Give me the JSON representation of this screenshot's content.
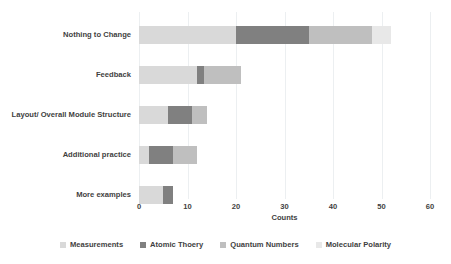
{
  "chart_data": {
    "type": "bar",
    "orientation": "horizontal",
    "stacked": true,
    "title": "",
    "xlabel": "Counts",
    "ylabel": "",
    "xlim": [
      0,
      60
    ],
    "ylim": null,
    "xticks": [
      "0",
      "10",
      "20",
      "30",
      "40",
      "50",
      "60"
    ],
    "grid": "vertical",
    "legend_position": "bottom",
    "categories": [
      "Nothing to Change",
      "Feedback",
      "Layout/ Overall Module Structure",
      "Additional practice",
      "More examples"
    ],
    "series": [
      {
        "name": "Measurements",
        "color": "#d9d9d9",
        "values": [
          20,
          12,
          6,
          2,
          5
        ]
      },
      {
        "name": "Atomic Thoery",
        "color": "#808080",
        "values": [
          15,
          1.5,
          5,
          5,
          2
        ]
      },
      {
        "name": "Quantum Numbers",
        "color": "#bfbfbf",
        "values": [
          13,
          7.5,
          3,
          5,
          0
        ]
      },
      {
        "name": "Molecular Polarity",
        "color": "#e8e8e8",
        "values": [
          4,
          0,
          0,
          0,
          0
        ]
      }
    ],
    "totals": [
      52,
      21,
      14,
      12,
      7
    ]
  },
  "axis": {
    "x_title": "Counts"
  },
  "colors": {
    "measurements": "#d9d9d9",
    "atomic_theory": "#808080",
    "quantum_numbers": "#bfbfbf",
    "molecular_polarity": "#e8e8e8",
    "gridline": "#eceff1",
    "axis": "#c9c9c9",
    "text": "#3f3f3f",
    "background": "#ffffff"
  }
}
